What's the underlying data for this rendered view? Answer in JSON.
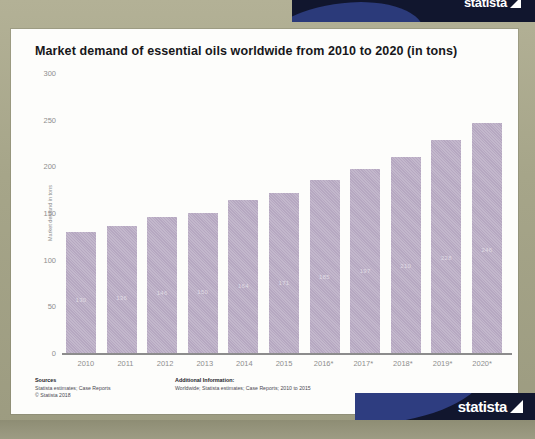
{
  "banner": {
    "brand": "statista",
    "mark_icon": "statista-triangle-icon"
  },
  "chart_data": {
    "type": "bar",
    "title": "Market demand of essential oils worldwide from 2010 to 2020 (in tons)",
    "xlabel": "",
    "ylabel": "Market demand in tons",
    "ylim": [
      0,
      300
    ],
    "yticks": [
      "0",
      "50",
      "100",
      "150",
      "200",
      "250",
      "300"
    ],
    "grid": false,
    "legend": "none",
    "categories": [
      "2010",
      "2011",
      "2012",
      "2013",
      "2014",
      "2015",
      "2016*",
      "2017*",
      "2018*",
      "2019*",
      "2020*"
    ],
    "values": [
      130,
      136,
      146,
      150,
      164,
      171,
      185,
      197,
      210,
      228,
      246
    ],
    "value_labels": [
      "130",
      "136",
      "146",
      "150",
      "164",
      "171",
      "185",
      "197",
      "210",
      "228",
      "246"
    ],
    "bar_color": "#b6a8c1",
    "note": "Values for 2016 to 2020 are marked with an asterisk (estimates)"
  },
  "footer": {
    "sources_heading": "Sources",
    "sources_line1": "Statista estimates; Case Reports",
    "sources_line2": "© Statista 2018",
    "additional_heading": "Additional Information:",
    "additional_line1": "Worldwide; Statista estimates; Case Reports; 2010 to 2015"
  }
}
